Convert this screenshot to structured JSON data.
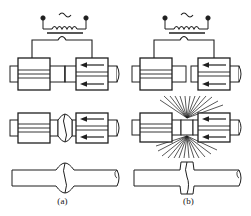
{
  "figure": {
    "stroke_color": "#1f1f1f",
    "fill_color": "#ffffff",
    "hatch_color": "#3a3a3a"
  },
  "panels": [
    {
      "id": "a",
      "caption": "(a)",
      "process": "upset butt welding",
      "circuit": {
        "ac_symbol": "~",
        "terminal_left": "terminal-dot",
        "terminal_right": "terminal-dot",
        "primary_coil": "coil-winding",
        "core": "transformer-core-bar",
        "secondary_loop": "secondary-loop"
      },
      "stages": [
        {
          "index": 1,
          "name": "setup",
          "left_clamp": "fixed-electrode-clamp",
          "right_clamp": "movable-electrode-clamp",
          "force_arrows": 2,
          "force_direction": "left",
          "joint": "workpieces-in-contact"
        },
        {
          "index": 2,
          "name": "upsetting",
          "joint": "rounded-upset-bulge",
          "force_arrows": 2,
          "force_direction": "left",
          "sparks": 0
        },
        {
          "index": 3,
          "name": "finished-weld",
          "joint": "rounded-upset-collar"
        }
      ]
    },
    {
      "id": "b",
      "caption": "(b)",
      "process": "flash butt welding",
      "circuit": {
        "ac_symbol": "~",
        "terminal_left": "terminal-dot",
        "terminal_right": "terminal-dot",
        "primary_coil": "coil-winding",
        "core": "transformer-core-bar",
        "secondary_loop": "secondary-loop"
      },
      "stages": [
        {
          "index": 1,
          "name": "setup",
          "left_clamp": "fixed-electrode-clamp",
          "right_clamp": "movable-electrode-clamp",
          "force_arrows": 2,
          "force_direction": "left",
          "joint": "workpieces-with-gap"
        },
        {
          "index": 2,
          "name": "flashing",
          "joint": "flashing-gap",
          "force_arrows": 2,
          "force_direction": "left",
          "sparks": 28
        },
        {
          "index": 3,
          "name": "finished-weld",
          "joint": "sharp-flash-collar"
        }
      ]
    }
  ]
}
